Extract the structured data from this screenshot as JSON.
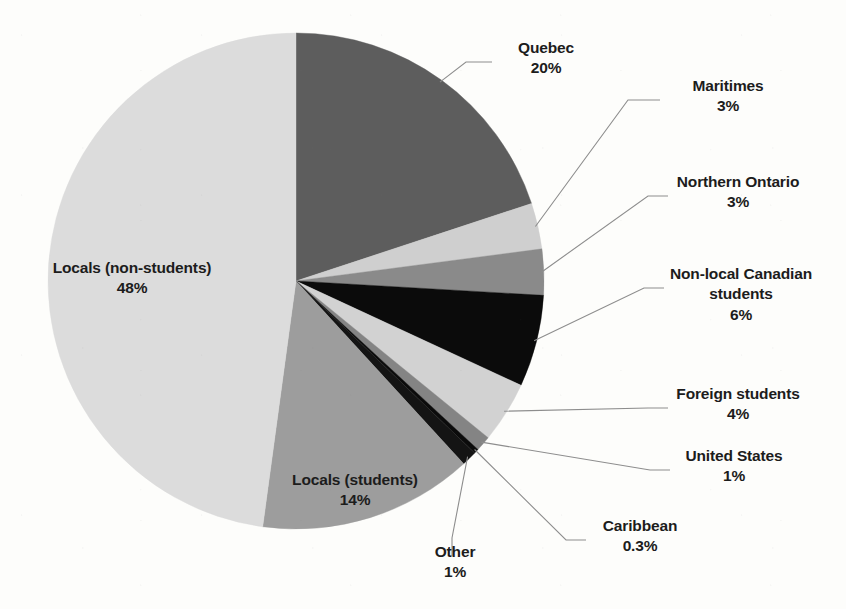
{
  "chart_data": {
    "type": "pie",
    "title": "",
    "subtitle": "",
    "xlabel": "",
    "ylabel": "",
    "grid": false,
    "legend_position": "none",
    "label_style": "category name above percentage, leader lines to small slices",
    "start_angle_deg": 0,
    "direction": "clockwise",
    "total_percent": 100.3,
    "categories": [
      "Quebec",
      "Maritimes",
      "Northern Ontario",
      "Non-local Canadian students",
      "Foreign students",
      "United States",
      "Caribbean",
      "Other",
      "Locals (students)",
      "Locals (non-students)"
    ],
    "values": [
      20,
      3,
      3,
      6,
      4,
      1,
      0.3,
      1,
      14,
      48
    ],
    "value_labels": [
      "20%",
      "3%",
      "3%",
      "6%",
      "4%",
      "1%",
      "0.3%",
      "1%",
      "14%",
      "48%"
    ],
    "colors": [
      "#5d5d5d",
      "#cfcfcf",
      "#8a8a8a",
      "#0b0b0b",
      "#d2d2d2",
      "#848484",
      "#0b0b0b",
      "#141414",
      "#9d9d9d",
      "#dcdcdc"
    ],
    "slices": [
      {
        "label": "Quebec",
        "value": 20,
        "value_label": "20%",
        "color": "#5d5d5d",
        "callout": true,
        "label_wraps": false
      },
      {
        "label": "Maritimes",
        "value": 3,
        "value_label": "3%",
        "color": "#cfcfcf",
        "callout": true,
        "label_wraps": false
      },
      {
        "label": "Northern Ontario",
        "value": 3,
        "value_label": "3%",
        "color": "#8a8a8a",
        "callout": true,
        "label_wraps": false
      },
      {
        "label": "Non-local Canadian students",
        "value": 6,
        "value_label": "6%",
        "color": "#0b0b0b",
        "callout": true,
        "label_wraps": true,
        "line1": "Non-local Canadian",
        "line2": "students"
      },
      {
        "label": "Foreign students",
        "value": 4,
        "value_label": "4%",
        "color": "#d2d2d2",
        "callout": true,
        "label_wraps": false
      },
      {
        "label": "United States",
        "value": 1,
        "value_label": "1%",
        "color": "#848484",
        "callout": true,
        "label_wraps": false
      },
      {
        "label": "Caribbean",
        "value": 0.3,
        "value_label": "0.3%",
        "color": "#0b0b0b",
        "callout": true,
        "label_wraps": false
      },
      {
        "label": "Other",
        "value": 1,
        "value_label": "1%",
        "color": "#141414",
        "callout": true,
        "label_wraps": false
      },
      {
        "label": "Locals (students)",
        "value": 14,
        "value_label": "14%",
        "color": "#9d9d9d",
        "callout": false,
        "label_wraps": false
      },
      {
        "label": "Locals (non-students)",
        "value": 48,
        "value_label": "48%",
        "color": "#dcdcdc",
        "callout": false,
        "label_wraps": false
      }
    ],
    "geometry": {
      "center_x": 296,
      "center_y": 281,
      "radius": 248,
      "background": "#fdfdfb",
      "leader_line_color": "#8d8d8d",
      "text_color": "#1c1c1c"
    }
  }
}
